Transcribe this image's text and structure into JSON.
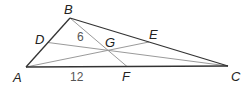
{
  "diagram": {
    "type": "triangle-medians-centroid",
    "points": {
      "A": {
        "label": "A",
        "x": 26,
        "y": 67
      },
      "B": {
        "label": "B",
        "x": 70,
        "y": 18
      },
      "C": {
        "label": "C",
        "x": 228,
        "y": 66
      },
      "D": {
        "label": "D",
        "x": 48,
        "y": 42.5
      },
      "E": {
        "label": "E",
        "x": 149,
        "y": 42
      },
      "F": {
        "label": "F",
        "x": 127,
        "y": 66.5
      },
      "G": {
        "label": "G",
        "x": 108,
        "y": 50
      }
    },
    "triangle_sides": [
      "AB",
      "BC",
      "CA"
    ],
    "medians": [
      "BF",
      "CD",
      "AE"
    ],
    "measurements": [
      {
        "segment": "BG",
        "value": "6"
      },
      {
        "segment": "AF",
        "value": "12"
      }
    ],
    "colors": {
      "triangle": "#333333",
      "median": "#9a9a9a",
      "label": "#222222",
      "measure": "#555555"
    }
  }
}
